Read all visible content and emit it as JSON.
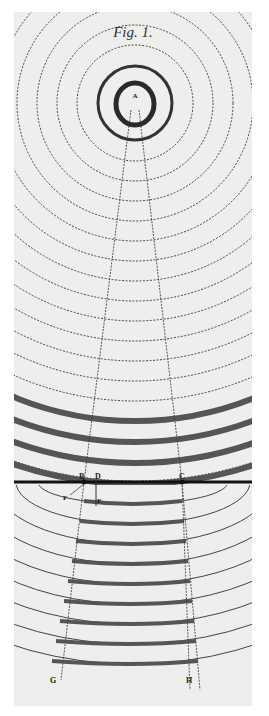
{
  "figure": {
    "title": "Fig. 1.",
    "labels": {
      "A": "A",
      "B": "B",
      "C": "C",
      "D": "D",
      "E": "E",
      "F": "F",
      "G": "G",
      "H": "H"
    },
    "colors": {
      "paper": "#eeeeec",
      "ink": "#2a2a2a",
      "band": "#555555",
      "dashed": "#444444"
    },
    "counts": {
      "dashed_wavefronts_upper": 17,
      "thick_bands_above_boundary": 4,
      "solid_wavefronts_lower": 9
    }
  }
}
